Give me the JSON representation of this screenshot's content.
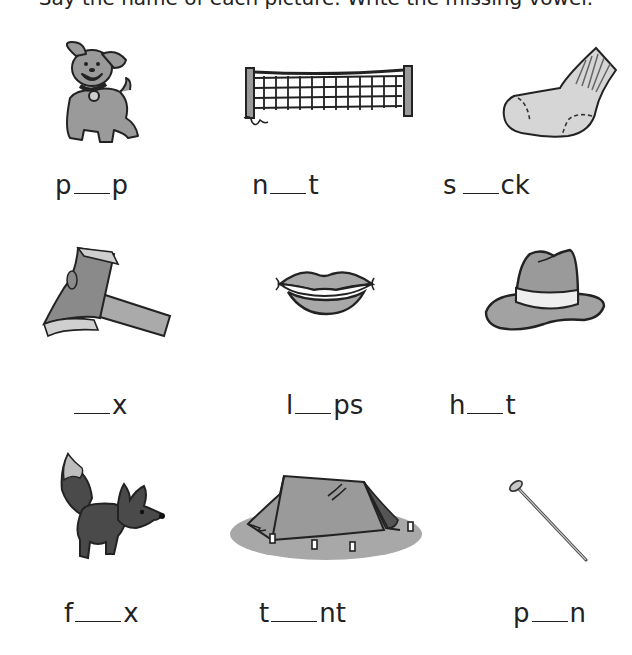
{
  "header": {
    "instruction_clipped": "Say the name of each picture. Write the missing vowel."
  },
  "items": [
    {
      "picture": "puppy",
      "prefix": "p",
      "suffix": "p",
      "blank_width": 40
    },
    {
      "picture": "net",
      "prefix": "n",
      "suffix": "t",
      "blank_width": 40
    },
    {
      "picture": "sock",
      "prefix": "s",
      "suffix": "ck",
      "blank_width": 40
    },
    {
      "picture": "ax",
      "prefix": "",
      "suffix": "x",
      "blank_width": 40
    },
    {
      "picture": "lips",
      "prefix": "l",
      "suffix": "ps",
      "blank_width": 40
    },
    {
      "picture": "hat",
      "prefix": "h",
      "suffix": "t",
      "blank_width": 40
    },
    {
      "picture": "fox",
      "prefix": "f",
      "suffix": "x",
      "blank_width": 50
    },
    {
      "picture": "tent",
      "prefix": "t",
      "suffix": "nt",
      "blank_width": 50
    },
    {
      "picture": "pin",
      "prefix": "p",
      "suffix": "n",
      "blank_width": 40
    }
  ],
  "colors": {
    "ink": "#222222",
    "fill_light": "#d6d6d6",
    "fill_mid": "#9a9a9a",
    "fill_dark": "#4a4a4a",
    "ground": "#a8a8a8"
  }
}
